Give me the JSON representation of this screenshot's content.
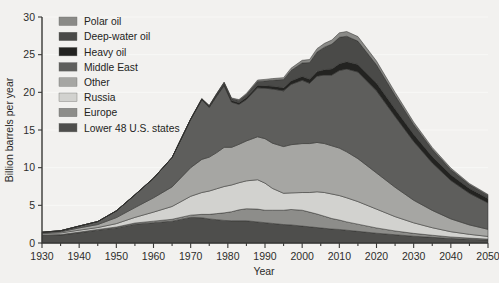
{
  "chart_data": {
    "type": "area",
    "title": "",
    "subtitle": "",
    "xlabel": "Year",
    "ylabel": "Billion barrels per year",
    "xlim": [
      1930,
      2050
    ],
    "ylim": [
      0,
      30
    ],
    "xticks": [
      1930,
      1940,
      1950,
      1960,
      1970,
      1980,
      1990,
      2000,
      2010,
      2020,
      2030,
      2040,
      2050
    ],
    "xtick_labels": [
      "1930",
      "1940",
      "1950",
      "1960",
      "1970",
      "1980",
      "1990",
      "2000",
      "2010",
      "2020",
      "2030",
      "2040",
      "2050"
    ],
    "xtick_minor_step": 5,
    "yticks": [
      0,
      5,
      10,
      15,
      20,
      25,
      30
    ],
    "ytick_labels": [
      "0",
      "5",
      "10",
      "15",
      "20",
      "25",
      "30"
    ],
    "grid": "horizontal-white",
    "legend_position": "top-left-inside",
    "stack_order_bottom_to_top": [
      "Lower 48 U.S. states",
      "Europe",
      "Russia",
      "Other",
      "Middle East",
      "Heavy oil",
      "Deep-water oil",
      "Polar oil"
    ],
    "x": [
      1930,
      1935,
      1940,
      1945,
      1950,
      1955,
      1960,
      1965,
      1970,
      1973,
      1975,
      1977,
      1979,
      1981,
      1983,
      1985,
      1988,
      1990,
      1992,
      1995,
      1997,
      2000,
      2002,
      2004,
      2006,
      2008,
      2010,
      2012,
      2015,
      2020,
      2025,
      2030,
      2035,
      2040,
      2045,
      2050
    ],
    "series": [
      {
        "name": "Lower 48 U.S. states",
        "color": "#4e4e4c",
        "values": [
          1.0,
          1.05,
          1.35,
          1.7,
          2.0,
          2.5,
          2.7,
          2.9,
          3.4,
          3.35,
          3.2,
          3.1,
          3.0,
          2.95,
          2.95,
          2.95,
          2.8,
          2.7,
          2.6,
          2.45,
          2.4,
          2.25,
          2.15,
          2.05,
          1.95,
          1.85,
          1.8,
          1.7,
          1.55,
          1.3,
          1.1,
          0.9,
          0.75,
          0.6,
          0.5,
          0.4
        ]
      },
      {
        "name": "Europe",
        "color": "#8d8d8a",
        "values": [
          0.08,
          0.08,
          0.1,
          0.1,
          0.12,
          0.15,
          0.2,
          0.25,
          0.3,
          0.45,
          0.6,
          0.8,
          1.0,
          1.2,
          1.45,
          1.6,
          1.7,
          1.65,
          1.75,
          1.9,
          2.05,
          2.1,
          1.95,
          1.8,
          1.6,
          1.4,
          1.25,
          1.1,
          0.95,
          0.7,
          0.5,
          0.38,
          0.28,
          0.2,
          0.15,
          0.12
        ]
      },
      {
        "name": "Russia",
        "color": "#d2d2cf",
        "values": [
          0.15,
          0.2,
          0.25,
          0.25,
          0.45,
          0.75,
          1.2,
          1.7,
          2.5,
          2.9,
          3.1,
          3.3,
          3.5,
          3.55,
          3.6,
          3.7,
          3.9,
          3.6,
          2.9,
          2.25,
          2.2,
          2.35,
          2.6,
          2.95,
          3.15,
          3.25,
          3.25,
          3.2,
          3.0,
          2.5,
          1.9,
          1.4,
          1.0,
          0.7,
          0.5,
          0.35
        ]
      },
      {
        "name": "Other",
        "color": "#a6a6a3",
        "values": [
          0.1,
          0.15,
          0.3,
          0.4,
          0.8,
          1.3,
          1.9,
          2.6,
          3.8,
          4.4,
          4.5,
          4.8,
          5.2,
          5.0,
          5.1,
          5.3,
          5.7,
          5.9,
          6.0,
          6.2,
          6.4,
          6.5,
          6.5,
          6.55,
          6.5,
          6.4,
          6.3,
          6.1,
          5.7,
          4.8,
          3.9,
          3.0,
          2.3,
          1.7,
          1.25,
          0.95
        ]
      },
      {
        "name": "Middle East",
        "color": "#5e5e5c",
        "values": [
          0.1,
          0.15,
          0.25,
          0.4,
          0.9,
          1.7,
          2.6,
          3.9,
          6.4,
          7.9,
          6.6,
          7.5,
          8.2,
          6.0,
          5.3,
          5.5,
          6.5,
          6.7,
          7.2,
          7.4,
          8.0,
          8.4,
          8.0,
          8.8,
          9.1,
          9.4,
          10.3,
          11.0,
          11.5,
          10.9,
          9.4,
          7.8,
          6.3,
          5.1,
          4.2,
          3.5
        ]
      },
      {
        "name": "Heavy oil",
        "color": "#232321",
        "values": [
          0.0,
          0.0,
          0.0,
          0.0,
          0.0,
          0.0,
          0.0,
          0.0,
          0.05,
          0.1,
          0.12,
          0.15,
          0.18,
          0.2,
          0.22,
          0.25,
          0.3,
          0.32,
          0.35,
          0.4,
          0.45,
          0.5,
          0.55,
          0.6,
          0.7,
          0.8,
          0.9,
          0.95,
          1.0,
          1.05,
          1.0,
          0.95,
          0.85,
          0.75,
          0.65,
          0.6
        ]
      },
      {
        "name": "Deep-water oil",
        "color": "#4a4a48",
        "values": [
          0.0,
          0.0,
          0.0,
          0.0,
          0.0,
          0.0,
          0.0,
          0.0,
          0.0,
          0.05,
          0.1,
          0.15,
          0.2,
          0.25,
          0.3,
          0.4,
          0.55,
          0.65,
          0.8,
          1.1,
          1.4,
          1.8,
          2.2,
          2.6,
          3.0,
          3.3,
          3.5,
          3.4,
          3.1,
          2.4,
          1.8,
          1.3,
          0.95,
          0.7,
          0.5,
          0.4
        ]
      },
      {
        "name": "Polar oil",
        "color": "#8a8a87",
        "values": [
          0.0,
          0.0,
          0.0,
          0.0,
          0.0,
          0.0,
          0.0,
          0.0,
          0.0,
          0.0,
          0.02,
          0.05,
          0.08,
          0.1,
          0.12,
          0.15,
          0.18,
          0.2,
          0.22,
          0.25,
          0.3,
          0.35,
          0.4,
          0.45,
          0.5,
          0.55,
          0.6,
          0.62,
          0.6,
          0.5,
          0.4,
          0.32,
          0.25,
          0.2,
          0.15,
          0.12
        ]
      }
    ],
    "legend_entries": [
      {
        "label": "Polar oil",
        "color": "#8a8a87"
      },
      {
        "label": "Deep-water oil",
        "color": "#4a4a48"
      },
      {
        "label": "Heavy oil",
        "color": "#232321"
      },
      {
        "label": "Middle East",
        "color": "#5e5e5c"
      },
      {
        "label": "Other",
        "color": "#a6a6a3"
      },
      {
        "label": "Russia",
        "color": "#d2d2cf"
      },
      {
        "label": "Europe",
        "color": "#8d8d8a"
      },
      {
        "label": "Lower 48 U.S. states",
        "color": "#4e4e4c"
      }
    ]
  }
}
